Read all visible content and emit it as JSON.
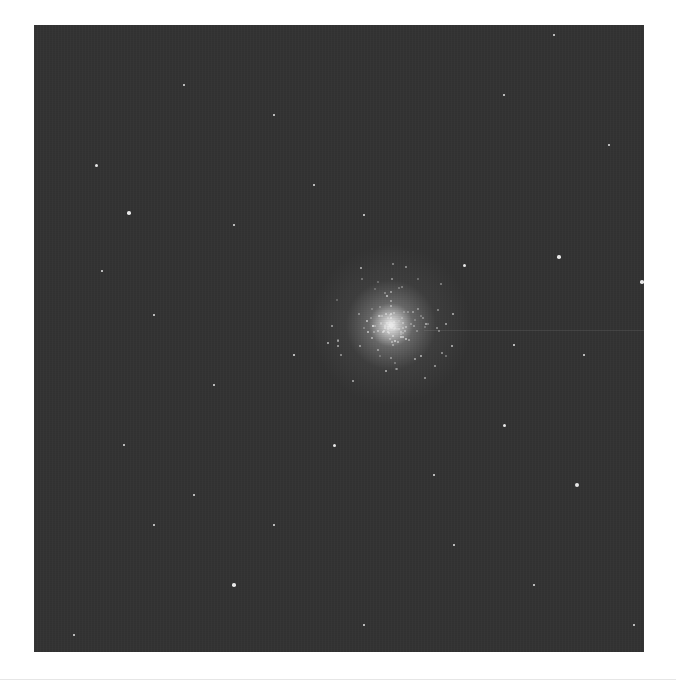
{
  "image": {
    "subject": "globular star cluster",
    "background_color": "#333333",
    "core_color": "#ffffff",
    "core_position": {
      "x": 357,
      "y": 300
    },
    "stars": [
      {
        "x": 62,
        "y": 140,
        "r": 1.5
      },
      {
        "x": 95,
        "y": 188,
        "r": 1.8
      },
      {
        "x": 68,
        "y": 246,
        "r": 1.3
      },
      {
        "x": 120,
        "y": 290,
        "r": 1.2
      },
      {
        "x": 200,
        "y": 200,
        "r": 1.3
      },
      {
        "x": 280,
        "y": 160,
        "r": 1.2
      },
      {
        "x": 330,
        "y": 190,
        "r": 1.3
      },
      {
        "x": 430,
        "y": 240,
        "r": 1.5
      },
      {
        "x": 470,
        "y": 70,
        "r": 1.2
      },
      {
        "x": 525,
        "y": 232,
        "r": 1.8
      },
      {
        "x": 608,
        "y": 257,
        "r": 1.8
      },
      {
        "x": 575,
        "y": 120,
        "r": 1.2
      },
      {
        "x": 520,
        "y": 10,
        "r": 1.2
      },
      {
        "x": 150,
        "y": 60,
        "r": 1.1
      },
      {
        "x": 240,
        "y": 90,
        "r": 1.1
      },
      {
        "x": 90,
        "y": 420,
        "r": 1.2
      },
      {
        "x": 160,
        "y": 470,
        "r": 1.3
      },
      {
        "x": 200,
        "y": 560,
        "r": 1.8
      },
      {
        "x": 120,
        "y": 500,
        "r": 1.2
      },
      {
        "x": 240,
        "y": 500,
        "r": 1.2
      },
      {
        "x": 300,
        "y": 420,
        "r": 1.5
      },
      {
        "x": 330,
        "y": 600,
        "r": 1.3
      },
      {
        "x": 400,
        "y": 450,
        "r": 1.2
      },
      {
        "x": 470,
        "y": 400,
        "r": 1.5
      },
      {
        "x": 543,
        "y": 460,
        "r": 2.2
      },
      {
        "x": 500,
        "y": 560,
        "r": 1.2
      },
      {
        "x": 420,
        "y": 520,
        "r": 1.2
      },
      {
        "x": 40,
        "y": 610,
        "r": 1.3
      },
      {
        "x": 600,
        "y": 600,
        "r": 1.2
      },
      {
        "x": 260,
        "y": 330,
        "r": 1.2
      },
      {
        "x": 550,
        "y": 330,
        "r": 1.2
      },
      {
        "x": 480,
        "y": 320,
        "r": 1.3
      },
      {
        "x": 180,
        "y": 360,
        "r": 1.1
      }
    ]
  }
}
